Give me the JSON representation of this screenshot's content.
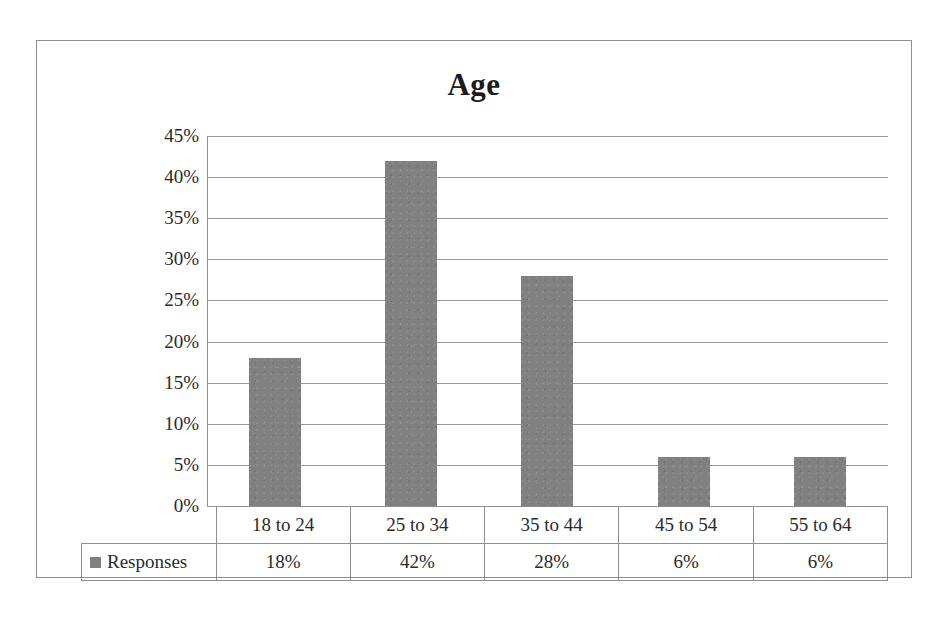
{
  "chart_data": {
    "type": "bar",
    "title": "Age",
    "xlabel": "",
    "ylabel": "",
    "categories": [
      "18 to 24",
      "25 to 34",
      "35 to 44",
      "45 to 54",
      "55 to 64"
    ],
    "values": [
      18,
      42,
      28,
      6,
      6
    ],
    "value_labels": [
      "18%",
      "42%",
      "28%",
      "6%",
      "6%"
    ],
    "series": [
      {
        "name": "Responses",
        "values": [
          18,
          42,
          28,
          6,
          6
        ],
        "color": "#808080"
      }
    ],
    "ylim": [
      0,
      45
    ],
    "ytick_values": [
      45,
      40,
      35,
      30,
      25,
      20,
      15,
      10,
      5,
      0
    ],
    "ytick_labels": [
      "45%",
      "40%",
      "35%",
      "30%",
      "25%",
      "20%",
      "15%",
      "10%",
      "5%",
      "0%"
    ],
    "grid": true,
    "legend_position": "data-table",
    "data_table_visible": true
  },
  "legend": {
    "series_label": "Responses",
    "swatch_color": "#808080"
  },
  "colors": {
    "bar": "#808080",
    "gridline": "#9a9a9a",
    "frame": "#8e8e8e",
    "text": "#2a2a2a",
    "title": "#1c1c1c",
    "background": "#ffffff"
  }
}
